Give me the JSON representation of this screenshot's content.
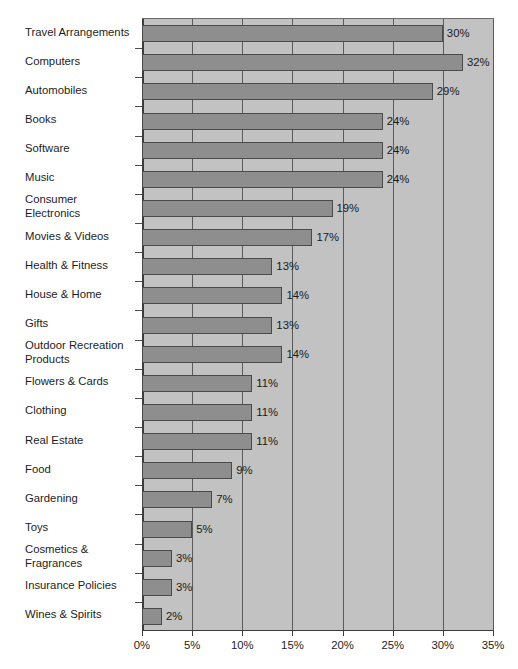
{
  "chart_data": {
    "type": "bar",
    "orientation": "horizontal",
    "title": "",
    "subtitle": "",
    "xlabel": "",
    "ylabel": "",
    "xlim": [
      0,
      35
    ],
    "xtick_labels": [
      "0%",
      "5%",
      "10%",
      "15%",
      "20%",
      "25%",
      "30%",
      "35%"
    ],
    "xticks": [
      0,
      5,
      10,
      15,
      20,
      25,
      30,
      35
    ],
    "grid": true,
    "legend": "none",
    "value_suffix": "%",
    "categories": [
      "Travel Arrangements",
      "Computers",
      "Automobiles",
      "Books",
      "Software",
      "Music",
      "Consumer\nElectronics",
      "Movies & Videos",
      "Health & Fitness",
      "House & Home",
      "Gifts",
      "Outdoor Recreation\nProducts",
      "Flowers & Cards",
      "Clothing",
      "Real Estate",
      "Food",
      "Gardening",
      "Toys",
      "Cosmetics &\nFragrances",
      "Insurance Policies",
      "Wines & Spirits"
    ],
    "values": [
      30,
      32,
      29,
      24,
      24,
      24,
      19,
      17,
      13,
      14,
      13,
      14,
      11,
      11,
      11,
      9,
      7,
      5,
      3,
      3,
      2
    ],
    "value_labels": [
      "30%",
      "32%",
      "29%",
      "24%",
      "24%",
      "24%",
      "19%",
      "17%",
      "13%",
      "14%",
      "13%",
      "14%",
      "11%",
      "11%",
      "11%",
      "9%",
      "7%",
      "5%",
      "3%",
      "3%",
      "2%"
    ]
  },
  "colors": {
    "bar_fill": "#8e8e8e",
    "bar_border": "#4a4a4a",
    "plot_background": "#c2c2c2",
    "gridline": "#5a5a5a",
    "axis": "#3d3d3d",
    "text": "#1d1d1d",
    "page_background": "#ffffff"
  }
}
